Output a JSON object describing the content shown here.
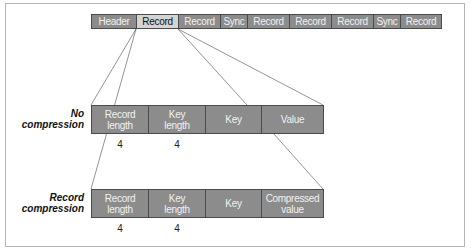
{
  "diagram": {
    "top_bar": {
      "cells": [
        {
          "label": "Header",
          "highlighted": false
        },
        {
          "label": "Record",
          "highlighted": true
        },
        {
          "label": "Record",
          "highlighted": false
        },
        {
          "label": "Sync",
          "highlighted": false
        },
        {
          "label": "Record",
          "highlighted": false
        },
        {
          "label": "Record",
          "highlighted": false
        },
        {
          "label": "Record",
          "highlighted": false
        },
        {
          "label": "Sync",
          "highlighted": false
        },
        {
          "label": "Record",
          "highlighted": false
        }
      ]
    },
    "rows": [
      {
        "label_line1": "No",
        "label_line2": "compression",
        "cells": [
          {
            "line1": "Record",
            "line2": "length",
            "size": "4"
          },
          {
            "line1": "Key",
            "line2": "length",
            "size": "4"
          },
          {
            "line1": "Key",
            "line2": "",
            "size": ""
          },
          {
            "line1": "Value",
            "line2": "",
            "size": ""
          }
        ]
      },
      {
        "label_line1": "Record",
        "label_line2": "compression",
        "cells": [
          {
            "line1": "Record",
            "line2": "length",
            "size": "4"
          },
          {
            "line1": "Key",
            "line2": "length",
            "size": "4"
          },
          {
            "line1": "Key",
            "line2": "",
            "size": ""
          },
          {
            "line1": "Compressed",
            "line2": "value",
            "size": ""
          }
        ]
      }
    ],
    "colors": {
      "cell_fill": "#8c8c8c",
      "highlight_fill": "#d4d4d4",
      "border": "#4a4a4a",
      "frame": "#b5b5b5"
    }
  }
}
